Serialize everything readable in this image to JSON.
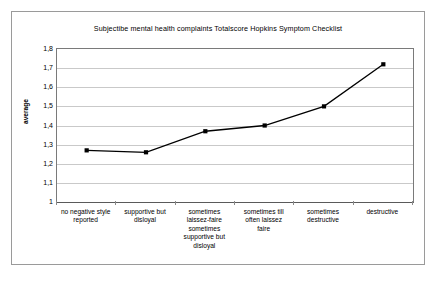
{
  "chart_data": {
    "type": "line",
    "title": "Subjectibe mental health complaints Totalscore Hopkins Symptom Checklist",
    "xlabel": "",
    "ylabel": "average",
    "ylim": [
      1,
      1.8
    ],
    "ytick_labels": [
      "1,8",
      "1,7",
      "1,6",
      "1,5",
      "1,4",
      "1,3",
      "1,2",
      "1,1",
      "1"
    ],
    "ytick_values": [
      1.8,
      1.7,
      1.6,
      1.5,
      1.4,
      1.3,
      1.2,
      1.1,
      1.0
    ],
    "grid": true,
    "legend": "none",
    "categories": [
      "no negative style reported",
      "supportive but disloyal",
      "sometimes laissez-faire sometimes supportive but disloyal",
      "sometimes till often laissez faire",
      "sometimes destructive",
      "destructive"
    ],
    "category_lines": [
      [
        "no negative style",
        "reported"
      ],
      [
        "supportive but",
        "disloyal"
      ],
      [
        "sometimes",
        "laissez-faire",
        "sometimes",
        "supportive but",
        "disloyal"
      ],
      [
        "sometimes till",
        "often laissez",
        "faire"
      ],
      [
        "sometimes",
        "destructive"
      ],
      [
        "destructive"
      ]
    ],
    "values": [
      1.27,
      1.26,
      1.37,
      1.4,
      1.5,
      1.72
    ],
    "series": [
      {
        "name": "average",
        "values": [
          1.27,
          1.26,
          1.37,
          1.4,
          1.5,
          1.72
        ],
        "color": "#000000",
        "marker": "square"
      }
    ]
  },
  "colors": {
    "line": "#000000",
    "grid": "#c9c9c9",
    "axis": "#7a7a7a",
    "frame": "#9a9a9a",
    "background": "#ffffff"
  }
}
